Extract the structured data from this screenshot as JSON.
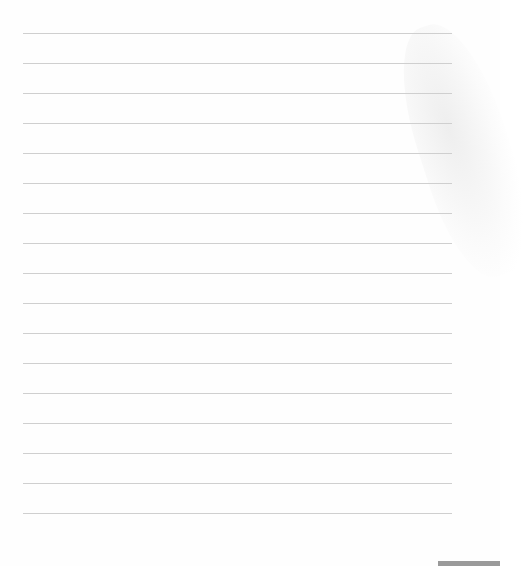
{
  "page": {
    "type": "lined-notebook-page",
    "background_color": "#fefefe",
    "rule_color": "#cfcfcf",
    "rule_count": 17,
    "rule_positions_y": [
      33,
      63,
      93,
      123,
      153,
      183,
      213,
      243,
      273,
      303,
      333,
      363,
      393,
      423,
      453,
      483,
      513
    ],
    "text_lines": [
      "",
      "",
      "",
      "",
      "",
      "",
      "",
      "",
      "",
      "",
      "",
      "",
      "",
      "",
      "",
      "",
      ""
    ]
  },
  "decorations": {
    "watermark": "faint-floral-watermark",
    "bottom_bar_color": "#9a9a9a"
  }
}
